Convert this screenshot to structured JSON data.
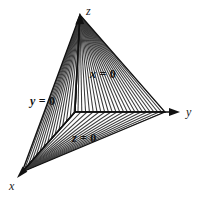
{
  "figure": {
    "type": "3d-coordinate-diagram",
    "background_color": "#ffffff",
    "line_color": "#1a1a1a",
    "hatch_color": "#333333"
  },
  "axes": [
    {
      "name": "x-axis",
      "label": "x",
      "direction": "down-left",
      "label_x": 9,
      "label_y": 180,
      "from": [
        75,
        112
      ],
      "to": [
        18,
        178
      ]
    },
    {
      "name": "y-axis",
      "label": "y",
      "direction": "right",
      "label_x": 186,
      "label_y": 106,
      "from": [
        75,
        112
      ],
      "to": [
        178,
        112
      ]
    },
    {
      "name": "z-axis",
      "label": "z",
      "direction": "up",
      "label_x": 86,
      "label_y": 5,
      "from": [
        75,
        112
      ],
      "to": [
        80,
        15
      ]
    }
  ],
  "planes": [
    {
      "name": "plane-x",
      "var": "x",
      "eq": " = 0",
      "full": "x = 0",
      "label_x": 90,
      "label_y": 68,
      "region": "upper-right",
      "hatch": "radial-from-z-apex"
    },
    {
      "name": "plane-y",
      "var": "y",
      "eq": " = 0",
      "full": "y = 0",
      "label_x": 30,
      "label_y": 95,
      "region": "left",
      "hatch": "radial-from-z-apex"
    },
    {
      "name": "plane-z",
      "var": "z",
      "eq": " = 0",
      "full": "z = 0",
      "label_x": 72,
      "label_y": 132,
      "region": "bottom",
      "hatch": "radial-from-x-vertex"
    }
  ],
  "vertices": {
    "origin": [
      75,
      112
    ],
    "z_apex": [
      80,
      15
    ],
    "y_vertex": [
      165,
      112
    ],
    "x_vertex": [
      22,
      172
    ]
  }
}
